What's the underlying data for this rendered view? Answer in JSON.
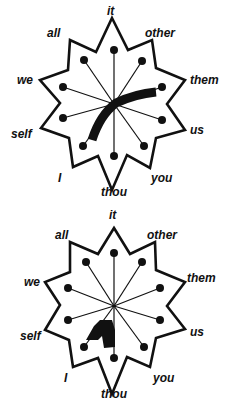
{
  "diagrams": [
    {
      "name": "top-wheel",
      "labels": {
        "it": "it",
        "other": "other",
        "them": "them",
        "us": "us",
        "you": "you",
        "thou": "thou",
        "i": "I",
        "self": "self",
        "we": "we",
        "all": "all"
      }
    },
    {
      "name": "bottom-wheel",
      "labels": {
        "it": "it",
        "other": "other",
        "them": "them",
        "us": "us",
        "you": "you",
        "thou": "thou",
        "i": "I",
        "self": "self",
        "we": "we",
        "all": "all"
      }
    }
  ],
  "colors": {
    "ink": "#111111",
    "background": "#ffffff"
  }
}
